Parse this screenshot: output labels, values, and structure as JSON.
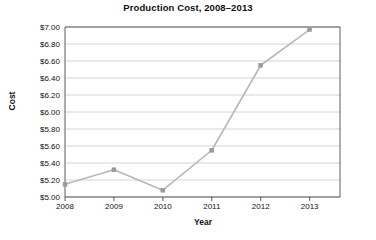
{
  "chart_data": {
    "type": "line",
    "title": "Production Cost, 2008–2013",
    "xlabel": "Year",
    "ylabel": "Cost",
    "categories": [
      "2008",
      "2009",
      "2010",
      "2011",
      "2012",
      "2013"
    ],
    "values": [
      5.15,
      5.32,
      5.08,
      5.55,
      6.55,
      6.97
    ],
    "series": [
      {
        "name": "Production Cost",
        "values": [
          5.15,
          5.32,
          5.08,
          5.55,
          6.55,
          6.97
        ]
      }
    ],
    "ylim": [
      5.0,
      7.0
    ],
    "ytick_step": 0.2,
    "ytick_labels": [
      "$5.00",
      "$5.20",
      "$5.40",
      "$5.60",
      "$5.80",
      "$6.00",
      "$6.20",
      "$6.40",
      "$6.60",
      "$6.80",
      "$7.00"
    ],
    "ytick_values": [
      5.0,
      5.2,
      5.4,
      5.6,
      5.8,
      6.0,
      6.2,
      6.4,
      6.6,
      6.8,
      7.0
    ],
    "xtick_labels": [
      "2008",
      "2009",
      "2010",
      "2011",
      "2012",
      "2013"
    ],
    "grid": "horizontal",
    "legend": "none",
    "colors": {
      "line": "#b8b8b8",
      "marker": "#9a9a9a",
      "grid": "#c9c9c9",
      "axis": "#4a4a4a",
      "text": "#111111",
      "background": "#ffffff"
    }
  }
}
